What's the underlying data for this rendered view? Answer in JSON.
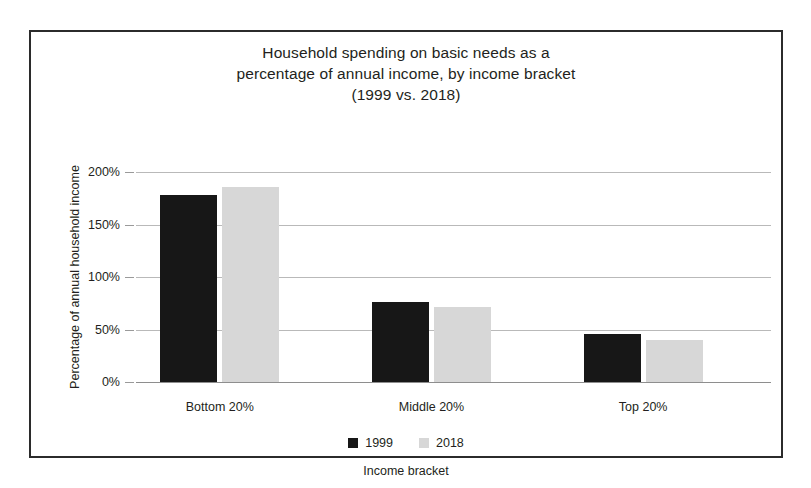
{
  "figure": {
    "frame_border_color": "#2b2b2b",
    "background": "#ffffff"
  },
  "chart_data": {
    "type": "bar",
    "title": "Household spending on basic needs as a percentage of annual income, by income bracket (1999 vs. 2018)",
    "title_lines": [
      "Household spending on basic needs as a",
      "percentage of annual income, by income bracket",
      "(1999 vs. 2018)"
    ],
    "xlabel": "Income bracket",
    "ylabel": "Percentage of annual household income",
    "categories": [
      "Bottom 20%",
      "Middle 20%",
      "Top 20%"
    ],
    "series": [
      {
        "name": "1999",
        "color": "#171717",
        "values": [
          178,
          76,
          46
        ]
      },
      {
        "name": "2018",
        "color": "#d7d7d7",
        "values": [
          186,
          71,
          40
        ]
      }
    ],
    "ylim": [
      0,
      200
    ],
    "yticks": [
      0,
      50,
      100,
      150,
      200
    ],
    "ytick_labels": [
      "0%",
      "50%",
      "100%",
      "150%",
      "200%"
    ],
    "grid": true,
    "legend_position": "bottom",
    "legend_entries": [
      "1999",
      "2018"
    ]
  }
}
